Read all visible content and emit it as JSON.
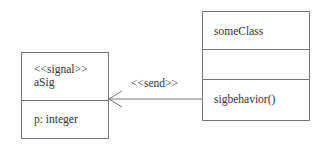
{
  "diagram": {
    "type": "UML class diagram",
    "signal_box": {
      "stereotype": "<<signal>>",
      "name": "aSig",
      "attributes": [
        "p: integer"
      ]
    },
    "class_box": {
      "name": "someClass",
      "attributes": [],
      "operations": [
        "sigbehavior()"
      ]
    },
    "relationship": {
      "label": "<<send>>",
      "from": "someClass.sigbehavior()",
      "to": "aSig",
      "arrow": "open-arrowhead"
    },
    "colors": {
      "line": "#777777",
      "text": "#333333",
      "background": "#ffffff"
    }
  }
}
